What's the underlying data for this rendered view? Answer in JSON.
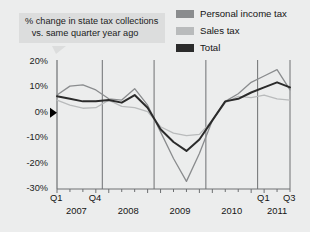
{
  "callout": {
    "line1": "% change in state tax collections",
    "line2": "vs. same quarter year ago"
  },
  "legend": {
    "items": [
      {
        "label": "Personal income tax",
        "color": "#8a8c8e"
      },
      {
        "label": "Sales tax",
        "color": "#b9bbbc"
      },
      {
        "label": "Total",
        "color": "#2b2b2b"
      }
    ]
  },
  "colors": {
    "background": "#eceded",
    "callout_background": "#dcdddd",
    "axis": "#6e7072",
    "gridline": "#6e7072",
    "text": "#141414",
    "zero_marker": "#000000"
  },
  "chart_data": {
    "type": "line",
    "title": "% change in state tax collections vs. same quarter year ago",
    "xlabel": "",
    "ylabel": "",
    "ylim": [
      -30,
      20
    ],
    "yticks": [
      20,
      10,
      0,
      -10,
      -20,
      -30
    ],
    "ytick_labels": [
      "20%",
      "10%",
      "0%",
      "-10%",
      "-20%",
      "-30%"
    ],
    "grid": false,
    "legend_position": "top-right",
    "year_separators": [
      "2007/2008",
      "2008/2009",
      "2009/2010",
      "2010/2011"
    ],
    "year_labels": [
      "2007",
      "2008",
      "2009",
      "2010",
      "2011"
    ],
    "x": [
      "Q1 2007",
      "Q2 2007",
      "Q3 2007",
      "Q4 2007",
      "Q1 2008",
      "Q2 2008",
      "Q3 2008",
      "Q4 2008",
      "Q1 2009",
      "Q2 2009",
      "Q3 2009",
      "Q4 2009",
      "Q1 2010",
      "Q2 2010",
      "Q3 2010",
      "Q4 2010",
      "Q1 2011",
      "Q2 2011",
      "Q3 2011"
    ],
    "xtick_labels": [
      {
        "index": 0,
        "label": "Q1"
      },
      {
        "index": 3,
        "label": "Q4"
      },
      {
        "index": 16,
        "label": "Q1"
      },
      {
        "index": 18,
        "label": "Q3"
      }
    ],
    "series": [
      {
        "name": "Personal income tax",
        "color": "#8a8c8e",
        "values": [
          7.0,
          10.5,
          11.0,
          9.0,
          5.5,
          5.0,
          9.5,
          3.0,
          -7.5,
          -18.0,
          -27.0,
          -16.0,
          -3.0,
          4.5,
          7.5,
          12.0,
          14.5,
          17.0,
          9.0
        ]
      },
      {
        "name": "Sales tax",
        "color": "#b9bbbc",
        "values": [
          5.0,
          3.0,
          1.8,
          2.0,
          5.0,
          2.5,
          2.0,
          0.5,
          -5.5,
          -8.0,
          -9.0,
          -8.5,
          -3.0,
          4.0,
          6.5,
          6.0,
          7.0,
          5.5,
          5.0
        ]
      },
      {
        "name": "Total",
        "color": "#2b2b2b",
        "values": [
          6.5,
          5.5,
          4.5,
          4.5,
          5.0,
          4.0,
          7.0,
          2.0,
          -6.5,
          -11.5,
          -15.0,
          -10.5,
          -3.0,
          4.5,
          5.5,
          8.0,
          10.0,
          12.0,
          10.0
        ]
      }
    ]
  },
  "axis_geometry": {
    "plot_left": 57,
    "plot_right": 290,
    "y_top_value": 20,
    "y_bottom_value": -30,
    "y_top_px": 62,
    "y_bottom_px": 189
  }
}
